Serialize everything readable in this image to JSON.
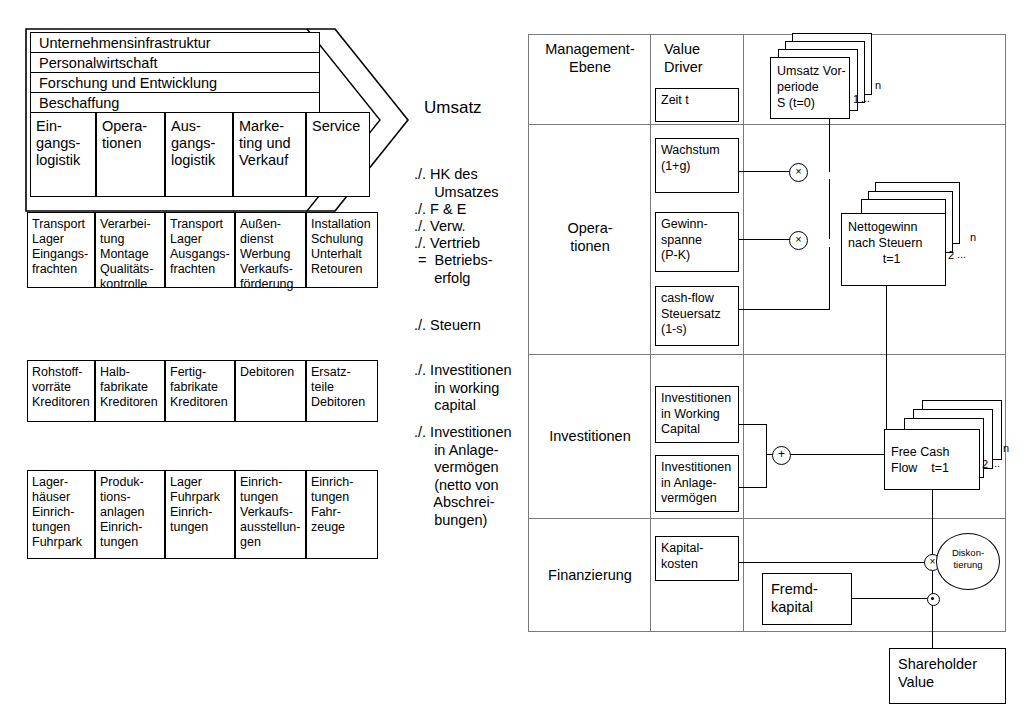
{
  "value_chain": {
    "support_activities": [
      "Unternehmensinfrastruktur",
      "Personalwirtschaft",
      "Forschung und Entwicklung",
      "Beschaffung"
    ],
    "primary_activities": [
      "Ein-\ngangs-\nlogistik",
      "Opera-\ntionen",
      "Aus-\ngangs-\nlogistik",
      "Marke-\nting und\nVerkauf",
      "Service"
    ],
    "rows": [
      {
        "name": "activities-row",
        "cells": [
          "Transport\nLager\nEingangs-\nfrachten",
          "Verarbei-\ntung\nMontage\nQualitäts-\nkontrolle",
          "Transport\nLager\nAusgangs-\nfrachten",
          "Außen-\ndienst\nWerbung\nVerkaufs-\nförderung",
          "Installation\nSchulung\nUnterhalt\nRetouren"
        ]
      },
      {
        "name": "working-capital-row",
        "cells": [
          "Rohstoff-\nvorräte\nKreditoren",
          "Halb-\nfabrikate\nKreditoren",
          "Fertig-\nfabrikate\nKreditoren",
          "Debitoren",
          "Ersatz-\nteile\nDebitoren"
        ]
      },
      {
        "name": "fixed-assets-row",
        "cells": [
          "Lager-\nhäuser\nEinrich-\ntungen\nFuhrpark",
          "Produk-\ntions-\nanlagen\nEinrich-\ntungen",
          "Lager\nFuhrpark\nEinrich-\ntungen",
          "Einrich-\ntungen\nVerkaufs-\nausstellun-\ngen",
          "Einrich-\ntungen\nFahr-\nzeuge"
        ]
      }
    ]
  },
  "calculation": {
    "title": "Umsatz",
    "lines": [
      "./. HK des\n     Umsatzes",
      "./. F & E",
      "./. Verw.",
      "./. Vertrieb",
      " =  Betriebs-\n     erfolg",
      "./. Steuern",
      "./. Investitionen\n     in working\n     capital",
      "./. Investitionen\n     in Anlage-\n     vermögen\n     (netto von\n     Abschrei-\n     bungen)"
    ]
  },
  "matrix": {
    "col_headers": {
      "management_level": "Management-\nEbene",
      "value_driver": "Value\nDriver"
    },
    "levels": [
      "Opera-\ntionen",
      "Investitionen",
      "Finanzierung"
    ],
    "value_drivers": [
      "Zeit t",
      "Wachstum\n(1+g)",
      "Gewinn-\nspanne\n(P-K)",
      "cash-flow\nSteuersatz\n(1-s)",
      "Investitionen\nin Working\nCapital",
      "Investitionen\nin Anlage-\nvermögen",
      "Kapital-\nkosten"
    ],
    "stacks": [
      {
        "label": "Umsatz Vor-\nperiode\nS (t=0)",
        "index_first": "1",
        "index_dots": "...",
        "index_last": "n"
      },
      {
        "label": "Nettogewinn\nnach Steuern\n          t=1",
        "index_first": "2",
        "index_dots": "...",
        "index_last": "n"
      },
      {
        "label": "Free Cash\nFlow    t=1",
        "index_first": "2",
        "index_dots": "...",
        "index_last": "n"
      }
    ],
    "operators": {
      "multiply_top": "×",
      "multiply_mid": "×",
      "plus": "+",
      "discount_multiply": "×",
      "subtract": "−"
    },
    "discount_label": "Diskon-\ntierung",
    "debt_box": "Fremd-\nkapital",
    "result_box": "Shareholder\nValue"
  },
  "colors": {
    "ink": "#000000",
    "grid": "#7a7a7a",
    "background": "#ffffff"
  }
}
